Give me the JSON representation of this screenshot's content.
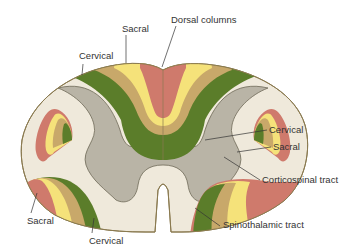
{
  "diagram": {
    "colors": {
      "white_matter": "#efe9db",
      "gray_matter": "#b9b4a6",
      "outline": "#8a7a50",
      "sacral": "#cf7a6c",
      "lumbar": "#f5e27a",
      "thoracic": "#c8a86a",
      "cervical": "#5b7d2a",
      "leader_line": "#333333"
    },
    "labels": {
      "dorsal_sacral": "Sacral",
      "dorsal_columns": "Dorsal columns",
      "dorsal_cervical": "Cervical",
      "cst_cervical": "Cervical",
      "cst_sacral": "Sacral",
      "corticospinal": "Corticospinal tract",
      "stt_sacral": "Sacral",
      "stt_cervical": "Cervical",
      "spinothalamic": "Spinothalamic tract"
    },
    "tracts": [
      {
        "name": "Dorsal columns",
        "order_medial_to_lateral": [
          "Sacral",
          "Lumbar",
          "Thoracic",
          "Cervical"
        ]
      },
      {
        "name": "Corticospinal tract",
        "order_medial_to_lateral": [
          "Cervical",
          "Thoracic",
          "Lumbar",
          "Sacral"
        ]
      },
      {
        "name": "Spinothalamic tract",
        "order_medial_to_lateral": [
          "Cervical",
          "Thoracic",
          "Lumbar",
          "Sacral"
        ]
      }
    ]
  }
}
